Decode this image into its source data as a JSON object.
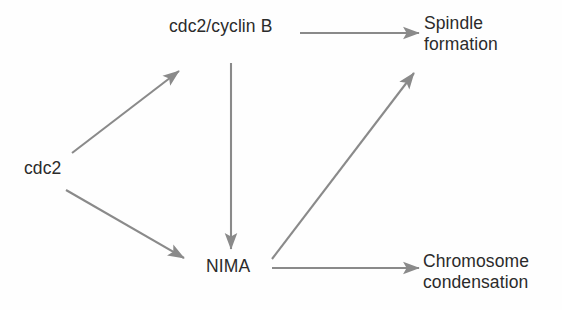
{
  "diagram": {
    "background_color": "#fefefe",
    "text_color": "#2b2b2b",
    "arrow_color": "#8a8a8a",
    "nodes": [
      {
        "id": "cdc2",
        "label": "cdc2",
        "x": 24,
        "y": 158
      },
      {
        "id": "cdc2_cyclin_b",
        "label": "cdc2/cyclin B",
        "x": 169,
        "y": 16
      },
      {
        "id": "nima",
        "label": "NIMA",
        "x": 206,
        "y": 256
      },
      {
        "id": "spindle_formation",
        "label": "Spindle\nformation",
        "x": 424,
        "y": 13
      },
      {
        "id": "chromosome_condensation",
        "label": "Chromosome\ncondensation",
        "x": 423,
        "y": 251
      }
    ],
    "edges": [
      {
        "id": "cdc2-to-cdc2-cyclin-b",
        "from": "cdc2",
        "to": "cdc2_cyclin_b",
        "direction": "up-right",
        "x1": 72,
        "y1": 153,
        "x2": 179,
        "y2": 71
      },
      {
        "id": "cdc2-to-nima",
        "from": "cdc2",
        "to": "nima",
        "direction": "down-right",
        "x1": 66,
        "y1": 190,
        "x2": 184,
        "y2": 258
      },
      {
        "id": "cdc2-cyclin-b-to-spindle-formation",
        "from": "cdc2_cyclin_b",
        "to": "spindle_formation",
        "direction": "right",
        "x1": 300,
        "y1": 33,
        "x2": 419,
        "y2": 33
      },
      {
        "id": "cdc2-cyclin-b-to-nima",
        "from": "cdc2_cyclin_b",
        "to": "nima",
        "direction": "down",
        "x1": 231,
        "y1": 63,
        "x2": 231,
        "y2": 249
      },
      {
        "id": "nima-to-spindle-formation",
        "from": "nima",
        "to": "spindle_formation",
        "direction": "up-right",
        "x1": 272,
        "y1": 259,
        "x2": 414,
        "y2": 73
      },
      {
        "id": "nima-to-chromosome-condensation",
        "from": "nima",
        "to": "chromosome_condensation",
        "direction": "right",
        "x1": 272,
        "y1": 268,
        "x2": 419,
        "y2": 268
      }
    ]
  }
}
